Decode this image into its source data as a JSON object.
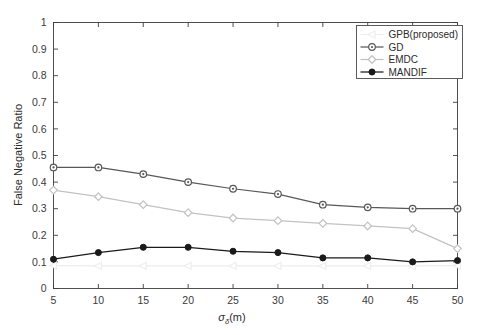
{
  "chart_data": {
    "type": "line",
    "title": "",
    "xlabel": "σδ(m)",
    "xlabel_base": "σ",
    "xlabel_sub": "δ",
    "xlabel_unit": "(m)",
    "ylabel": "False Negative Ratio",
    "xlim": [
      5,
      50
    ],
    "ylim": [
      0,
      1
    ],
    "xticks": [
      5,
      10,
      15,
      20,
      25,
      30,
      35,
      40,
      45,
      50
    ],
    "xtick_labels": [
      "5",
      "10",
      "15",
      "20",
      "25",
      "30",
      "35",
      "40",
      "45",
      "50"
    ],
    "yticks": [
      0,
      0.1,
      0.2,
      0.3,
      0.4,
      0.5,
      0.6,
      0.7,
      0.8,
      0.9,
      1
    ],
    "ytick_labels": [
      "0",
      "0.1",
      "0.2",
      "0.3",
      "0.4",
      "0.5",
      "0.6",
      "0.7",
      "0.8",
      "0.9",
      "1"
    ],
    "grid": false,
    "legend_position": "upper right",
    "x": [
      5,
      10,
      15,
      20,
      25,
      30,
      35,
      40,
      45,
      50
    ],
    "series": [
      {
        "name": "GPB(proposed)",
        "marker": "left-triangle",
        "color": "#ededed",
        "values": [
          0.086,
          0.085,
          0.085,
          0.085,
          0.085,
          0.085,
          0.085,
          0.085,
          0.085,
          0.086
        ]
      },
      {
        "name": "GD",
        "marker": "circle",
        "color": "#585858",
        "values": [
          0.455,
          0.455,
          0.43,
          0.4,
          0.375,
          0.355,
          0.315,
          0.305,
          0.3,
          0.3
        ]
      },
      {
        "name": "EMDC",
        "marker": "diamond",
        "color": "#c2c2c2",
        "values": [
          0.37,
          0.345,
          0.315,
          0.285,
          0.265,
          0.255,
          0.245,
          0.235,
          0.225,
          0.15
        ]
      },
      {
        "name": "MANDIF",
        "marker": "filled-circle",
        "color": "#1a1a1a",
        "values": [
          0.11,
          0.135,
          0.155,
          0.155,
          0.14,
          0.135,
          0.115,
          0.115,
          0.1,
          0.105
        ]
      }
    ]
  },
  "legend": {
    "entries": [
      {
        "label": "GPB(proposed)"
      },
      {
        "label": "GD"
      },
      {
        "label": "EMDC"
      },
      {
        "label": "MANDIF"
      }
    ]
  }
}
